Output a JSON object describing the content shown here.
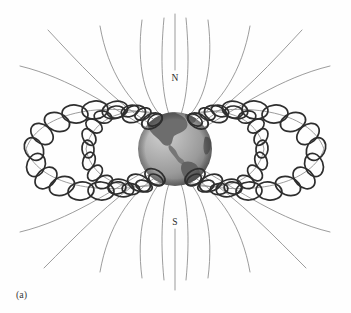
{
  "figure": {
    "caption": "(a)",
    "background_color": "#fefefe",
    "labels": {
      "north_pole": "N",
      "south_pole": "S"
    },
    "colors": {
      "field_line": "#8a8a8a",
      "axis_line": "#8a8a8a",
      "helix": "#2e2e2e",
      "earth_ocean_light": "#b9b9b9",
      "earth_ocean_mid": "#a0a0a0",
      "earth_ocean_dark": "#6e6e6e",
      "earth_land": "#6a6a6a",
      "label_text": "#2b2b2b",
      "caption_text": "#3a3a3a"
    },
    "geometry": {
      "earth_center_x": 175,
      "earth_center_y": 149,
      "earth_radius": 37,
      "axis_top_y": 14,
      "axis_bottom_y": 290,
      "north_label_x": 175,
      "north_label_y": 78,
      "south_label_x": 175,
      "south_label_y": 222,
      "caption_x": 16,
      "caption_y": 296
    },
    "elements": {
      "field_line_count": 10,
      "belt_loop_count": 2,
      "helix_turns_outer": 16,
      "helix_turns_inner": 16
    }
  }
}
